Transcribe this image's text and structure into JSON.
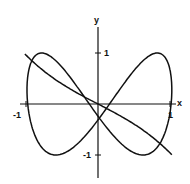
{
  "chart_data": {
    "type": "line",
    "title": "",
    "xlabel": "x",
    "ylabel": "y",
    "xlim": [
      -1.1,
      1.1
    ],
    "ylim": [
      -1.45,
      1.5
    ],
    "grid": false,
    "legend": null,
    "x_ticks": [
      {
        "value": -1,
        "label": "-1"
      },
      {
        "value": 1,
        "label": "1"
      }
    ],
    "y_ticks": [
      {
        "value": 1,
        "label": "1"
      },
      {
        "value": -1,
        "label": "-1"
      }
    ],
    "series": [
      {
        "name": "closed-loop-curve",
        "kind": "parametric",
        "description": "Figure-eight-like closed curve through origin",
        "key_points": [
          {
            "x": -1.0,
            "y": 0.0
          },
          {
            "x": -0.35,
            "y": 1.0
          },
          {
            "x": 0.0,
            "y": 0.9
          },
          {
            "x": 0.87,
            "y": 1.0
          },
          {
            "x": 1.04,
            "y": 0.27
          },
          {
            "x": 0.37,
            "y": -1.0
          },
          {
            "x": 0.0,
            "y": -0.9
          },
          {
            "x": -0.82,
            "y": -1.0
          }
        ]
      },
      {
        "name": "s-curve",
        "kind": "function",
        "description": "Decreasing curve through origin from upper-left to lower-right",
        "key_points": [
          {
            "x": -1.03,
            "y": 0.96
          },
          {
            "x": -0.5,
            "y": 0.4
          },
          {
            "x": 0.0,
            "y": 0.0
          },
          {
            "x": 0.5,
            "y": -0.4
          },
          {
            "x": 1.04,
            "y": -1.0
          }
        ]
      }
    ]
  },
  "axes": {
    "x_label": "x",
    "y_label": "y",
    "x_tick_neg": "-1",
    "x_tick_pos": "1",
    "y_tick_pos": "1",
    "y_tick_neg": "-1"
  },
  "colors": {
    "ink": "#111111",
    "background": "#ffffff"
  }
}
